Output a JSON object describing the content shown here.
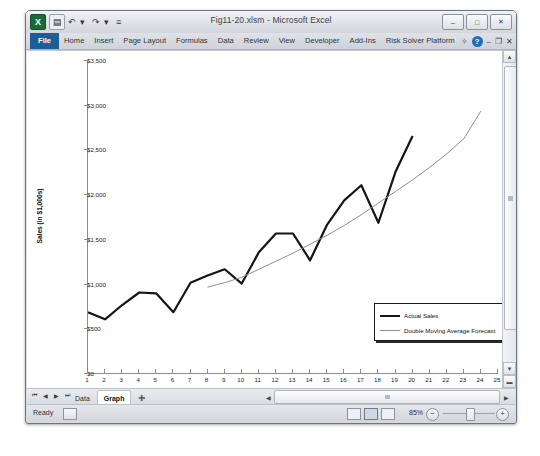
{
  "window": {
    "title": "Fig11-20.xlsm - Microsoft Excel",
    "quick_access": [
      {
        "name": "excel-logo-icon",
        "glyph": "X"
      },
      {
        "name": "save-icon",
        "glyph": "▤"
      },
      {
        "name": "undo-icon",
        "glyph": "↶"
      },
      {
        "name": "undo-dropdown-icon",
        "glyph": "▾"
      },
      {
        "name": "redo-icon",
        "glyph": "↷"
      },
      {
        "name": "redo-dropdown-icon",
        "glyph": "▾"
      },
      {
        "name": "customize-qat-icon",
        "glyph": "≡"
      }
    ],
    "controls": [
      {
        "name": "minimize-button",
        "glyph": "–"
      },
      {
        "name": "restore-button",
        "glyph": "□"
      },
      {
        "name": "close-button",
        "glyph": "✕"
      }
    ]
  },
  "ribbon": {
    "tabs": [
      {
        "label": "File",
        "active": true
      },
      {
        "label": "Home",
        "active": false
      },
      {
        "label": "Insert",
        "active": false
      },
      {
        "label": "Page Layout",
        "active": false
      },
      {
        "label": "Formulas",
        "active": false
      },
      {
        "label": "Data",
        "active": false
      },
      {
        "label": "Review",
        "active": false
      },
      {
        "label": "View",
        "active": false
      },
      {
        "label": "Developer",
        "active": false
      },
      {
        "label": "Add-Ins",
        "active": false
      },
      {
        "label": "Risk Solver Platform",
        "active": false
      }
    ],
    "right_icons": [
      {
        "name": "collapse-ribbon-icon",
        "glyph": "✧"
      },
      {
        "name": "help-icon",
        "glyph": "?"
      },
      {
        "name": "minimize-workbook-icon",
        "glyph": "–"
      },
      {
        "name": "restore-workbook-icon",
        "glyph": "❐"
      },
      {
        "name": "close-workbook-icon",
        "glyph": "✕"
      }
    ]
  },
  "sheet_tabs": {
    "nav": [
      {
        "name": "first-sheet-button",
        "glyph": "⏮"
      },
      {
        "name": "prev-sheet-button",
        "glyph": "◀"
      },
      {
        "name": "next-sheet-button",
        "glyph": "▶"
      },
      {
        "name": "last-sheet-button",
        "glyph": "⏭"
      }
    ],
    "tabs": [
      {
        "label": "Data",
        "active": false
      },
      {
        "label": "Graph",
        "active": true
      }
    ],
    "insert_tab_icon": "➕"
  },
  "status_bar": {
    "state": "Ready",
    "macro_icon": "record-macro-icon",
    "views": [
      {
        "name": "normal-view-button",
        "active": false
      },
      {
        "name": "page-layout-view-button",
        "active": true
      },
      {
        "name": "page-break-view-button",
        "active": false
      }
    ],
    "zoom_level": "85%",
    "zoom_out_glyph": "−",
    "zoom_in_glyph": "+"
  },
  "chart_data": {
    "type": "line",
    "title": "",
    "xlabel": "Time Period",
    "ylabel": "Sales (in $1,000s)",
    "xlim": [
      1,
      25
    ],
    "ylim": [
      0,
      3500
    ],
    "ytick_labels": [
      "$0",
      "$500",
      "$1,000",
      "$1,500",
      "$2,000",
      "$2,500",
      "$3,000",
      "$3,500"
    ],
    "ytick_values": [
      0,
      500,
      1000,
      1500,
      2000,
      2500,
      3000,
      3500
    ],
    "xtick_labels": [
      "1",
      "2",
      "3",
      "4",
      "5",
      "6",
      "7",
      "8",
      "9",
      "10",
      "11",
      "12",
      "13",
      "14",
      "15",
      "16",
      "17",
      "18",
      "19",
      "20",
      "21",
      "22",
      "23",
      "24",
      "25"
    ],
    "grid": false,
    "legend_position": "inside-bottom-right",
    "x": [
      1,
      2,
      3,
      4,
      5,
      6,
      7,
      8,
      9,
      10,
      11,
      12,
      13,
      14,
      15,
      16,
      17,
      18,
      19,
      20,
      21,
      22,
      23,
      24,
      25
    ],
    "series": [
      {
        "name": "Actual Sales",
        "color": "#151515",
        "width": 2.2,
        "x": [
          1,
          2,
          3,
          4,
          5,
          6,
          7,
          8,
          9,
          10,
          11,
          12,
          13,
          14,
          15,
          16,
          17,
          18,
          19,
          20
        ],
        "values": [
          680,
          600,
          760,
          900,
          890,
          680,
          1010,
          1090,
          1160,
          1000,
          1350,
          1560,
          1560,
          1260,
          1660,
          1930,
          2100,
          1680,
          2250,
          2650
        ]
      },
      {
        "name": "Double Moving Average Forecast",
        "color": "#8e8e8e",
        "width": 1,
        "x": [
          8,
          9,
          10,
          11,
          12,
          13,
          14,
          15,
          16,
          17,
          18,
          19,
          20,
          21,
          22,
          23,
          24
        ],
        "values": [
          960,
          1010,
          1070,
          1160,
          1250,
          1340,
          1440,
          1540,
          1650,
          1770,
          1900,
          2030,
          2160,
          2300,
          2450,
          2620,
          2930
        ]
      }
    ],
    "legend": [
      {
        "label": "Actual Sales",
        "style": "thick-black-line"
      },
      {
        "label": "Double Moving Average Forecast",
        "style": "thin-gray-line"
      }
    ]
  }
}
